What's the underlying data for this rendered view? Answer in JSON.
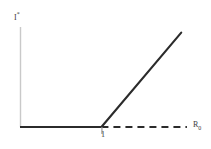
{
  "figure": {
    "width": 211,
    "height": 149,
    "background": "#ffffff"
  },
  "axes": {
    "y_label_main": "I",
    "y_label_sup": "*",
    "x_label_main": "R",
    "x_label_sub": "0",
    "axis_color": "#c9c9c9",
    "tick_color": "#9a9a9a"
  },
  "ticks": {
    "x": [
      {
        "label": "1",
        "value": 1
      }
    ]
  },
  "curves": {
    "stable_zero_color": "#2b2b2b",
    "stable_branch_color": "#2b2b2b",
    "unstable_dashed_color": "#2b2b2b",
    "dash_pattern": "7,5"
  },
  "chart_data": {
    "type": "line",
    "title": "",
    "xlabel": "R0",
    "ylabel": "I*",
    "xlim": [
      0,
      2.1
    ],
    "ylim": [
      0,
      1.25
    ],
    "grid": false,
    "legend": "none",
    "xticks": [
      1
    ],
    "xticklabels": [
      "1"
    ],
    "yticks": [],
    "yticklabels": [],
    "series": [
      {
        "name": "disease-free equilibrium (stable)",
        "style": "solid",
        "color": "#2b2b2b",
        "x": [
          0,
          1
        ],
        "y": [
          0,
          0
        ]
      },
      {
        "name": "disease-free equilibrium (unstable)",
        "style": "dashed",
        "color": "#2b2b2b",
        "x": [
          1,
          2.05
        ],
        "y": [
          0,
          0
        ]
      },
      {
        "name": "endemic equilibrium (stable)",
        "style": "solid",
        "color": "#2b2b2b",
        "x": [
          1,
          1.98
        ],
        "y": [
          0,
          1.18
        ]
      }
    ],
    "annotations": [
      {
        "text": "1",
        "x": 1,
        "y": 0,
        "position": "below-axis"
      },
      {
        "text": "R0",
        "x": 2.1,
        "y": 0,
        "position": "axis-end"
      },
      {
        "text": "I*",
        "x": 0,
        "y": 1.25,
        "position": "axis-top"
      }
    ]
  }
}
